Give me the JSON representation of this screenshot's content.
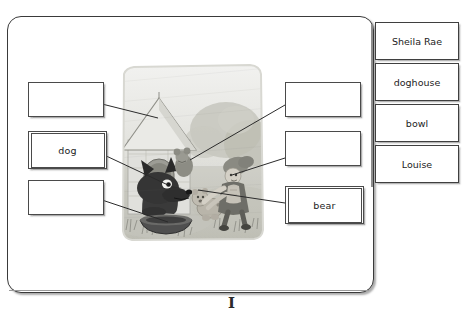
{
  "page": {
    "marker": "I"
  },
  "answer_boxes": {
    "left": [
      {
        "id": "box-l1",
        "value": "",
        "filled": false,
        "target": "doghouse-roof"
      },
      {
        "id": "box-l2",
        "value": "dog",
        "filled": true,
        "target": "dog-head"
      },
      {
        "id": "box-l3",
        "value": "",
        "filled": false,
        "target": "bowl"
      }
    ],
    "right": [
      {
        "id": "box-r1",
        "value": "",
        "filled": false,
        "target": "sheila-rae"
      },
      {
        "id": "box-r2",
        "value": "",
        "filled": false,
        "target": "louise"
      },
      {
        "id": "box-r3",
        "value": "bear",
        "filled": true,
        "target": "toy-bear"
      }
    ]
  },
  "word_bank": {
    "items": [
      {
        "label": "Sheila Rae"
      },
      {
        "label": "doghouse"
      },
      {
        "label": "bowl"
      },
      {
        "label": "Louise"
      }
    ]
  },
  "illustration": {
    "alt": "Grayscale storybook drawing of a dark dog in a doghouse with a bowl, and two mice pulling a toy bear",
    "colors": {
      "sky": "#e8e8e6",
      "ground": "#c9c9c2",
      "dog": "#4a4a4a",
      "house": "#dcdcd8",
      "mouse": "#9a9a94",
      "bear": "#b6b2a8"
    }
  },
  "theme": {
    "panel_border": "#3a3a3a",
    "box_border": "#4a4a4a",
    "text": "#1c1c1c",
    "spine": "#8d8d8d",
    "wire": "#2b2b2b"
  }
}
